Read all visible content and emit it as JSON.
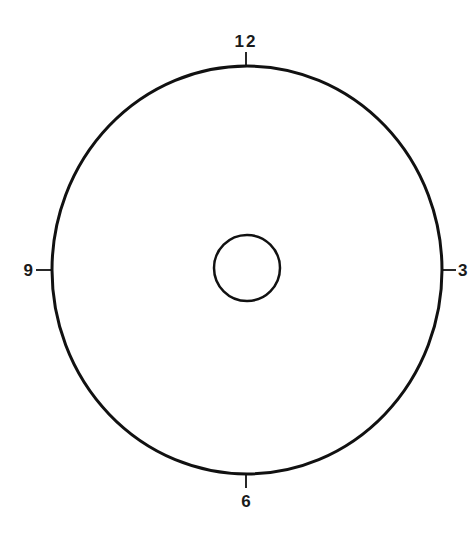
{
  "diagram": {
    "type": "clock-face",
    "labels": {
      "top": "12",
      "right": "3",
      "bottom": "6",
      "left": "9"
    },
    "colors": {
      "stroke": "#111111",
      "background": "#ffffff"
    }
  }
}
